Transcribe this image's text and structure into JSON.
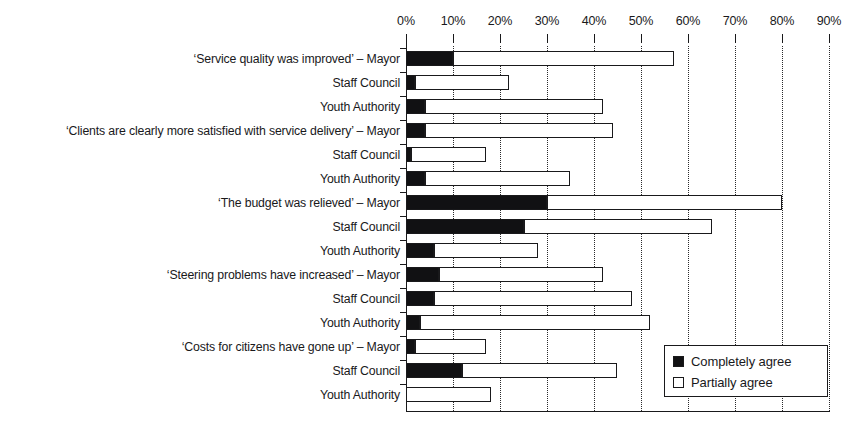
{
  "chart_data": {
    "type": "bar",
    "orientation": "horizontal",
    "stacked": true,
    "title": "",
    "xlabel": "",
    "ylabel": "",
    "xlim": [
      0,
      90
    ],
    "grid": true,
    "legend_position": "bottom-right",
    "xticks": [
      "0%",
      "10%",
      "20%",
      "30%",
      "40%",
      "50%",
      "60%",
      "70%",
      "80%",
      "90%"
    ],
    "xtick_values": [
      0,
      10,
      20,
      30,
      40,
      50,
      60,
      70,
      80,
      90
    ],
    "categories": [
      "‘Service quality was improved’ – Mayor",
      "Staff Council",
      "Youth Authority",
      "‘Clients are clearly more satisfied with service delivery’ – Mayor",
      "Staff Council",
      "Youth Authority",
      "‘The budget was relieved’ – Mayor",
      "Staff Council",
      "Youth Authority",
      "‘Steering problems have increased’ – Mayor",
      "Staff Council",
      "Youth Authority",
      "‘Costs for citizens have gone up’ – Mayor",
      "Staff Council",
      "Youth Authority"
    ],
    "series": [
      {
        "name": "Completely agree",
        "color": "#111113",
        "values": [
          10,
          2,
          4,
          4,
          1,
          4,
          30,
          25,
          6,
          7,
          6,
          3,
          2,
          12,
          0
        ]
      },
      {
        "name": "Partially agree",
        "color": "#ffffff",
        "values": [
          47,
          20,
          38,
          40,
          16,
          31,
          50,
          40,
          22,
          35,
          42,
          49,
          15,
          33,
          18
        ]
      }
    ],
    "totals": [
      57,
      22,
      42,
      44,
      17,
      35,
      80,
      65,
      28,
      42,
      48,
      52,
      17,
      45,
      18
    ]
  },
  "legend": {
    "items": [
      {
        "label": "Completely agree",
        "swatch": "black"
      },
      {
        "label": "Partially agree",
        "swatch": "white"
      }
    ]
  }
}
